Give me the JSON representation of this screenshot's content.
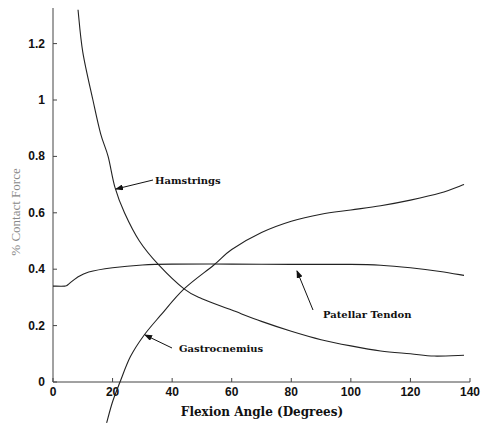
{
  "chart_data": {
    "type": "line",
    "title": "",
    "xlabel": "Flexion Angle (Degrees)",
    "ylabel": "% Contact Force",
    "xlim": [
      0,
      140
    ],
    "ylim": [
      0,
      1.32
    ],
    "xticks": [
      0,
      20,
      40,
      60,
      80,
      100,
      120,
      140
    ],
    "yticks": [
      0,
      0.2,
      0.4,
      0.6,
      0.8,
      1,
      1.2
    ],
    "xtick_labels": [
      "0",
      "20",
      "40",
      "60",
      "80",
      "100",
      "120",
      "140"
    ],
    "ytick_labels": [
      "0",
      "0.2",
      "0.4",
      "0.6",
      "0.8",
      "1",
      "1.2"
    ],
    "grid": false,
    "legend": "none (inline annotations with arrows)",
    "series": [
      {
        "name": "Hamstrings",
        "x": [
          8.4,
          10,
          13.4,
          16,
          18.5,
          20.8,
          24,
          29,
          35.5,
          44,
          50,
          60,
          70,
          80,
          90,
          100,
          110,
          120,
          128,
          138
        ],
        "y": [
          1.32,
          1.17,
          1.0,
          0.88,
          0.8,
          0.69,
          0.6,
          0.5,
          0.415,
          0.33,
          0.295,
          0.255,
          0.215,
          0.18,
          0.15,
          0.128,
          0.11,
          0.1,
          0.092,
          0.095
        ]
      },
      {
        "name": "Patellar Tendon",
        "x": [
          0,
          4,
          5,
          8,
          12,
          20,
          30,
          40,
          60,
          80,
          100,
          110,
          120,
          130,
          138
        ],
        "y": [
          0.34,
          0.34,
          0.345,
          0.37,
          0.39,
          0.405,
          0.415,
          0.418,
          0.418,
          0.417,
          0.417,
          0.414,
          0.405,
          0.392,
          0.378
        ]
      },
      {
        "name": "Gastrocnemius",
        "x": [
          18,
          20,
          22.5,
          26,
          30.5,
          36,
          44,
          54,
          60,
          70,
          80,
          90,
          100,
          110,
          120,
          130,
          138
        ],
        "y": [
          -0.145,
          -0.07,
          0.0,
          0.09,
          0.165,
          0.235,
          0.33,
          0.415,
          0.47,
          0.53,
          0.57,
          0.595,
          0.61,
          0.625,
          0.645,
          0.67,
          0.7
        ]
      }
    ],
    "annotations": [
      {
        "text": "Hamstrings",
        "arrow_to": [
          20.8,
          0.69
        ],
        "label_at": [
          34,
          0.71
        ]
      },
      {
        "text": "Patellar Tendon",
        "arrow_to": [
          82,
          0.42
        ],
        "label_at": [
          91,
          0.24
        ]
      },
      {
        "text": "Gastrocnemius",
        "arrow_to": [
          31,
          0.165
        ],
        "label_at": [
          42,
          0.11
        ]
      }
    ]
  },
  "labels": {
    "xlabel": "Flexion Angle (Degrees)",
    "ylabel": "% Contact Force",
    "hamstrings": "Hamstrings",
    "patellar": "Patellar Tendon",
    "gastrocnemius": "Gastrocnemius"
  }
}
